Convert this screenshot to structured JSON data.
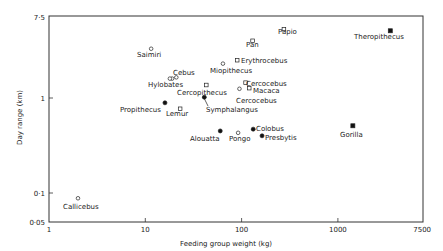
{
  "chart_data": {
    "type": "scatter",
    "title": "",
    "xlabel": "Feeding group weight (kg)",
    "ylabel": "Day range (km)",
    "xscale": "log",
    "yscale": "log",
    "xlim": [
      1,
      7500
    ],
    "ylim": [
      0.05,
      7.5
    ],
    "x_ticks": [
      {
        "value": 1,
        "label": "1"
      },
      {
        "value": 10,
        "label": "10"
      },
      {
        "value": 100,
        "label": "100"
      },
      {
        "value": 1000,
        "label": "1000"
      },
      {
        "value": 7500,
        "label": "7500"
      }
    ],
    "y_ticks": [
      {
        "value": 0.05,
        "label": "0·05"
      },
      {
        "value": 0.1,
        "label": "0·1"
      },
      {
        "value": 1,
        "label": "1"
      },
      {
        "value": 7.5,
        "label": "7·5"
      }
    ],
    "grid": false,
    "legend": null,
    "marker_key": {
      "open_circle": "open circle",
      "open_square": "open square",
      "filled_circle": "filled circle",
      "filled_square": "filled square"
    },
    "points": [
      {
        "label": "Papio",
        "x": 275,
        "y": 5.3,
        "marker": "open_square",
        "lx": 278,
        "ly": 34
      },
      {
        "label": "Theropithecus",
        "x": 3500,
        "y": 5.1,
        "marker": "filled_square",
        "lx": 354,
        "ly": 39
      },
      {
        "label": "Pan",
        "x": 130,
        "y": 4.0,
        "marker": "open_square",
        "lx": 246,
        "ly": 47
      },
      {
        "label": "Saimiri",
        "x": 11.5,
        "y": 3.3,
        "marker": "open_circle",
        "lx": 137,
        "ly": 57
      },
      {
        "label": "Erythrocebus",
        "x": 90,
        "y": 2.5,
        "marker": "open_square",
        "lx": 241,
        "ly": 63
      },
      {
        "label": "Miopithecus",
        "x": 64,
        "y": 2.3,
        "marker": "open_circle",
        "lx": 210,
        "ly": 73
      },
      {
        "label": "Cebus",
        "x": 21,
        "y": 1.65,
        "marker": "open_circle",
        "lx": 173,
        "ly": 75
      },
      {
        "label": "Hylobates",
        "x": 19,
        "y": 1.6,
        "marker": "open_circle",
        "lx": 148,
        "ly": 87
      },
      {
        "label": "Cercopithecus",
        "x": 43,
        "y": 1.37,
        "marker": "open_square",
        "lx": 177,
        "ly": 95
      },
      {
        "label": "Cercocebus",
        "x": 110,
        "y": 1.45,
        "marker": "open_square",
        "lx": 246,
        "ly": 86
      },
      {
        "label": "Macaca",
        "x": 120,
        "y": 1.27,
        "marker": "open_square",
        "lx": 253,
        "ly": 93
      },
      {
        "label": "Cercocebus",
        "x": 95,
        "y": 1.25,
        "marker": "open_circle",
        "lx": 236,
        "ly": 103
      },
      {
        "label": "Propithecus",
        "x": 16,
        "y": 0.89,
        "marker": "filled_circle",
        "lx": 120,
        "ly": 112
      },
      {
        "label": "Lemur",
        "x": 23,
        "y": 0.77,
        "marker": "open_square",
        "lx": 166,
        "ly": 116
      },
      {
        "label": "Symphalangus",
        "x": 41,
        "y": 1.02,
        "marker": "filled_circle",
        "lx": 206,
        "ly": 112
      },
      {
        "label": "Alouatta",
        "x": 60,
        "y": 0.45,
        "marker": "filled_circle",
        "lx": 190,
        "ly": 141
      },
      {
        "label": "Pongo",
        "x": 92,
        "y": 0.43,
        "marker": "open_circle",
        "lx": 229,
        "ly": 141
      },
      {
        "label": "Colobus",
        "x": 132,
        "y": 0.47,
        "marker": "filled_circle",
        "lx": 256,
        "ly": 131
      },
      {
        "label": "Presbytis",
        "x": 163,
        "y": 0.4,
        "marker": "filled_circle",
        "lx": 265,
        "ly": 140
      },
      {
        "label": "Gorilla",
        "x": 1430,
        "y": 0.51,
        "marker": "filled_square",
        "lx": 340,
        "ly": 137
      },
      {
        "label": "Callicebus",
        "x": 2,
        "y": 0.088,
        "marker": "open_circle",
        "lx": 63,
        "ly": 209
      }
    ],
    "annotations": [
      {
        "type": "leader-line",
        "from": "Symphalangus label",
        "to": "Symphalangus point"
      }
    ]
  }
}
